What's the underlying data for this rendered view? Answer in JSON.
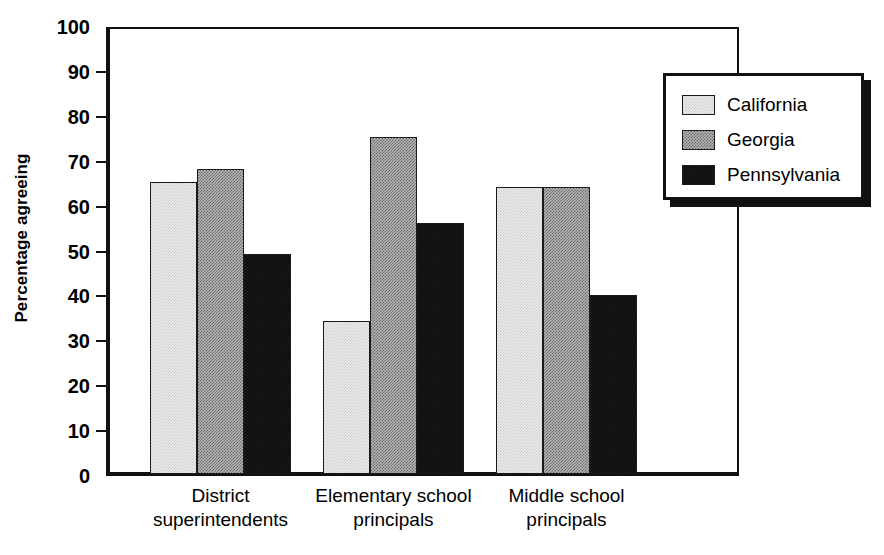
{
  "chart_data": {
    "type": "bar",
    "title": "",
    "xlabel": "",
    "ylabel": "Percentage agreeing",
    "ylim": [
      0,
      100
    ],
    "yticks": [
      0,
      10,
      20,
      30,
      40,
      50,
      60,
      70,
      80,
      90,
      100
    ],
    "grid": false,
    "legend_position": "top-right",
    "categories": [
      "District\nsuperintendents",
      "Elementary school\nprincipals",
      "Middle school\nprincipals"
    ],
    "category_lines": [
      [
        "District",
        "superintendents"
      ],
      [
        "Elementary school",
        "principals"
      ],
      [
        "Middle school",
        "principals"
      ]
    ],
    "series": [
      {
        "name": "California",
        "values": [
          65,
          34,
          64
        ],
        "color": "#ededed",
        "pattern": "light-stipple"
      },
      {
        "name": "Georgia",
        "values": [
          68,
          75,
          64
        ],
        "color": "#b4b4b4",
        "pattern": "medium-checker"
      },
      {
        "name": "Pennsylvania",
        "values": [
          49,
          56,
          39.8
        ],
        "color": "#0c0c0c",
        "pattern": "solid-black"
      }
    ]
  },
  "axis": {
    "tick_labels": [
      "100",
      "90",
      "80",
      "70",
      "60",
      "50",
      "40",
      "30",
      "20",
      "10",
      "0"
    ],
    "y_title": "Percentage agreeing"
  },
  "legend": {
    "entries": [
      {
        "label": "California"
      },
      {
        "label": "Georgia"
      },
      {
        "label": "Pennsylvania"
      }
    ]
  }
}
